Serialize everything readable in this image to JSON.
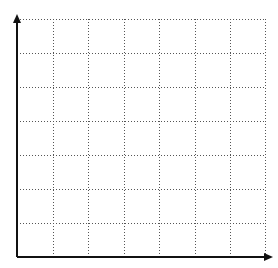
{
  "diagram": {
    "type": "blank-coordinate-grid",
    "columns": 7,
    "rows": 7,
    "grid": {
      "x_lines": [
        17,
        53,
        88,
        124,
        159,
        195,
        230,
        265
      ],
      "y_lines": [
        19,
        53,
        87,
        121,
        155,
        189,
        223,
        257
      ],
      "style": "dotted",
      "color": "#555555"
    },
    "axes": {
      "origin": [
        17,
        257
      ],
      "x_axis_end": 273,
      "y_axis_end": 14,
      "color": "#111111",
      "arrowheads": true
    },
    "labels": []
  }
}
